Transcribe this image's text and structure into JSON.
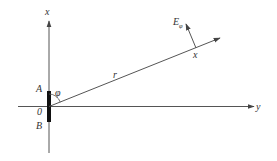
{
  "diagram": {
    "type": "dipole-antenna-coordinate-sketch",
    "colors": {
      "line": "#555555",
      "antenna": "#111111",
      "text": "#333333",
      "background": "#ffffff"
    },
    "axes": {
      "vertical": {
        "label": "x"
      },
      "horizontal": {
        "label": "y"
      }
    },
    "antenna": {
      "top_label": "A",
      "origin_label": "0",
      "bottom_label": "B"
    },
    "angle": {
      "label": "φ"
    },
    "ray": {
      "label": "r",
      "far_point_label": "x"
    },
    "field_vector": {
      "label": "E",
      "subscript": "φ"
    }
  }
}
